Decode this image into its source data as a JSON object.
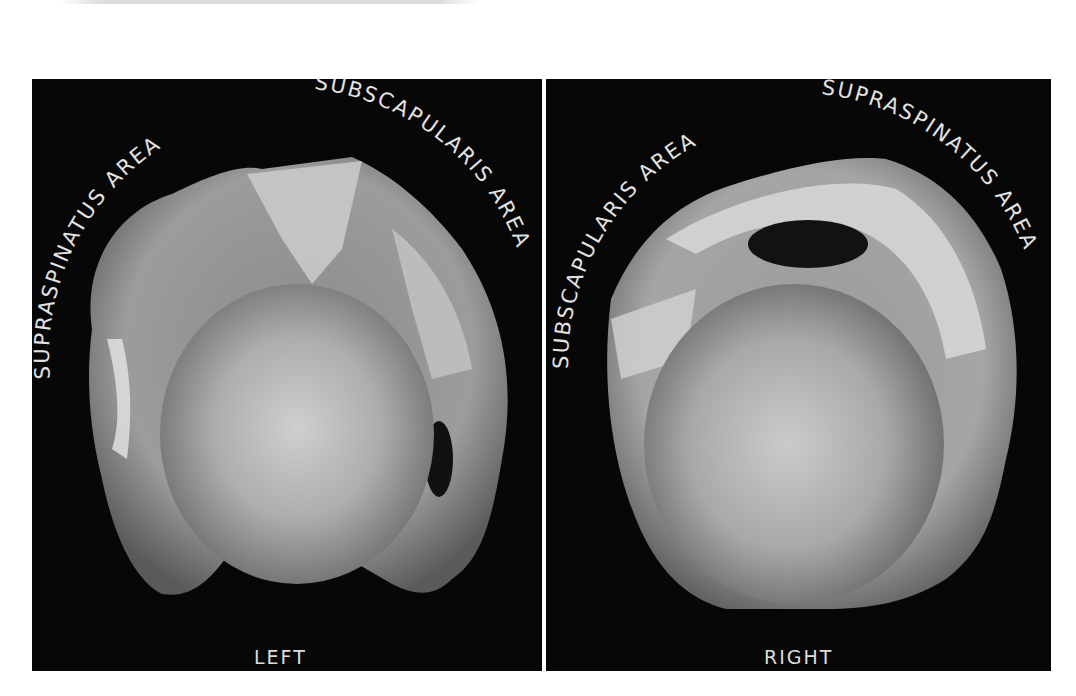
{
  "figure": {
    "panels": [
      {
        "id": "left",
        "side_label": "LEFT",
        "arc_labels": [
          "SUPRASPINATUS AREA",
          "SUBSCAPULARIS AREA"
        ]
      },
      {
        "id": "right",
        "side_label": "RIGHT",
        "arc_labels": [
          "SUBSCAPULARIS AREA",
          "SUPRASPINATUS AREA"
        ]
      }
    ],
    "colors": {
      "panel_background": "#070707",
      "label_text": "#e2e2e2",
      "page_background": "#ffffff"
    }
  }
}
